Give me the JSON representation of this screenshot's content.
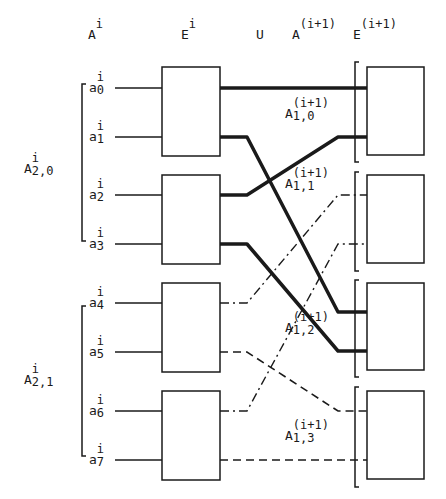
{
  "diagram": {
    "column_headers": [
      {
        "base": "A",
        "sup": "i",
        "x": 88
      },
      {
        "base": "E",
        "sup": "i",
        "x": 181
      },
      {
        "base": "U",
        "sup": "",
        "x": 256
      },
      {
        "base": "A",
        "sup": "(i+1)",
        "x": 292
      },
      {
        "base": "E",
        "sup": "(i+1)",
        "x": 353
      }
    ],
    "inputs": [
      {
        "base": "a",
        "sup": "i",
        "sub": "0",
        "y": 88
      },
      {
        "base": "a",
        "sup": "i",
        "sub": "1",
        "y": 137
      },
      {
        "base": "a",
        "sup": "i",
        "sub": "2",
        "y": 195
      },
      {
        "base": "a",
        "sup": "i",
        "sub": "3",
        "y": 244
      },
      {
        "base": "a",
        "sup": "i",
        "sub": "4",
        "y": 303
      },
      {
        "base": "a",
        "sup": "i",
        "sub": "5",
        "y": 352
      },
      {
        "base": "a",
        "sup": "i",
        "sub": "6",
        "y": 411
      },
      {
        "base": "a",
        "sup": "i",
        "sub": "7",
        "y": 460
      }
    ],
    "left_groups": [
      {
        "base": "A",
        "sup": "i",
        "sub": "2,0"
      },
      {
        "base": "A",
        "sup": "i",
        "sub": "2,1"
      }
    ],
    "right_groups": [
      {
        "base": "A",
        "sup": "(i+1)",
        "sub": "1,0"
      },
      {
        "base": "A",
        "sup": "(i+1)",
        "sub": "1,1"
      },
      {
        "base": "A",
        "sup": "(i+1)",
        "sub": "1,2"
      },
      {
        "base": "A",
        "sup": "(i+1)",
        "sub": "1,3"
      }
    ],
    "left_boxes_label": "E^i",
    "right_boxes_label": "E^(i+1)",
    "connections": [
      {
        "from": 0,
        "to": 0,
        "style": "bold"
      },
      {
        "from": 1,
        "to": 4,
        "style": "bold"
      },
      {
        "from": 2,
        "to": 1,
        "style": "bold"
      },
      {
        "from": 3,
        "to": 5,
        "style": "bold"
      },
      {
        "from": 4,
        "to": 2,
        "style": "dash-dot"
      },
      {
        "from": 5,
        "to": 6,
        "style": "dashed"
      },
      {
        "from": 6,
        "to": 3,
        "style": "dash-dot"
      },
      {
        "from": 7,
        "to": 7,
        "style": "dashed"
      }
    ],
    "colors": {
      "ink": "#1a1a1a",
      "background": "#ffffff"
    }
  }
}
